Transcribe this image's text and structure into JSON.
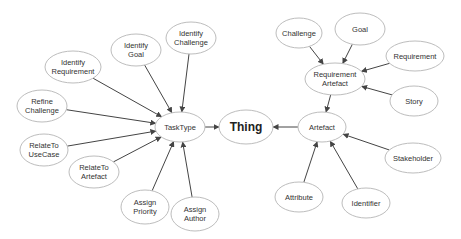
{
  "diagram": {
    "type": "concept-hierarchy",
    "colors": {
      "node_fill": "#ffffff",
      "node_stroke": "#bdbdbd",
      "edge": "#444444",
      "text": "#333333"
    },
    "nodes": [
      {
        "id": "thing",
        "lines": [
          "Thing"
        ],
        "cx": 246,
        "cy": 127,
        "rx": 27,
        "ry": 17,
        "root": true
      },
      {
        "id": "tasktype",
        "lines": [
          "TaskType"
        ],
        "cx": 180,
        "cy": 127,
        "rx": 25,
        "ry": 15
      },
      {
        "id": "artefact",
        "lines": [
          "Artefact"
        ],
        "cx": 322,
        "cy": 127,
        "rx": 24,
        "ry": 15
      },
      {
        "id": "identify-requirement",
        "lines": [
          "Identify",
          "Requirement"
        ],
        "cx": 73,
        "cy": 67,
        "rx": 28,
        "ry": 16
      },
      {
        "id": "identify-goal",
        "lines": [
          "Identify",
          "Goal"
        ],
        "cx": 136,
        "cy": 50,
        "rx": 25,
        "ry": 16
      },
      {
        "id": "identify-challenge",
        "lines": [
          "Identify",
          "Challenge"
        ],
        "cx": 191,
        "cy": 38,
        "rx": 25,
        "ry": 16
      },
      {
        "id": "refine-challenge",
        "lines": [
          "Refine",
          "Challenge"
        ],
        "cx": 42,
        "cy": 106,
        "rx": 25,
        "ry": 16
      },
      {
        "id": "relateto-usecase",
        "lines": [
          "RelateTo",
          "UseCase"
        ],
        "cx": 44,
        "cy": 150,
        "rx": 24,
        "ry": 16
      },
      {
        "id": "relateto-artefact",
        "lines": [
          "RelateTo",
          "Artefact"
        ],
        "cx": 94,
        "cy": 172,
        "rx": 25,
        "ry": 16
      },
      {
        "id": "assign-priority",
        "lines": [
          "Assign",
          "Priority"
        ],
        "cx": 145,
        "cy": 207,
        "rx": 24,
        "ry": 17
      },
      {
        "id": "assign-author",
        "lines": [
          "Assign",
          "Author"
        ],
        "cx": 195,
        "cy": 214,
        "rx": 24,
        "ry": 17
      },
      {
        "id": "requirement-artefact",
        "lines": [
          "Requirement",
          "Artefact"
        ],
        "cx": 335,
        "cy": 79,
        "rx": 30,
        "ry": 16
      },
      {
        "id": "challenge",
        "lines": [
          "Challenge"
        ],
        "cx": 299,
        "cy": 33,
        "rx": 23,
        "ry": 15
      },
      {
        "id": "goal",
        "lines": [
          "Goal"
        ],
        "cx": 360,
        "cy": 29,
        "rx": 25,
        "ry": 16
      },
      {
        "id": "requirement",
        "lines": [
          "Requirement"
        ],
        "cx": 415,
        "cy": 56,
        "rx": 29,
        "ry": 15
      },
      {
        "id": "story",
        "lines": [
          "Story"
        ],
        "cx": 414,
        "cy": 101,
        "rx": 24,
        "ry": 15
      },
      {
        "id": "stakeholder",
        "lines": [
          "Stakeholder"
        ],
        "cx": 413,
        "cy": 158,
        "rx": 28,
        "ry": 15
      },
      {
        "id": "attribute",
        "lines": [
          "Attribute"
        ],
        "cx": 299,
        "cy": 197,
        "rx": 24,
        "ry": 15
      },
      {
        "id": "identifier",
        "lines": [
          "Identifier"
        ],
        "cx": 366,
        "cy": 203,
        "rx": 24,
        "ry": 15
      }
    ],
    "edges": [
      {
        "from": "tasktype",
        "to": "thing"
      },
      {
        "from": "artefact",
        "to": "thing"
      },
      {
        "from": "identify-requirement",
        "to": "tasktype"
      },
      {
        "from": "identify-goal",
        "to": "tasktype"
      },
      {
        "from": "identify-challenge",
        "to": "tasktype"
      },
      {
        "from": "refine-challenge",
        "to": "tasktype"
      },
      {
        "from": "relateto-usecase",
        "to": "tasktype"
      },
      {
        "from": "relateto-artefact",
        "to": "tasktype"
      },
      {
        "from": "assign-priority",
        "to": "tasktype"
      },
      {
        "from": "assign-author",
        "to": "tasktype"
      },
      {
        "from": "requirement-artefact",
        "to": "artefact"
      },
      {
        "from": "challenge",
        "to": "requirement-artefact"
      },
      {
        "from": "goal",
        "to": "requirement-artefact"
      },
      {
        "from": "requirement",
        "to": "requirement-artefact"
      },
      {
        "from": "story",
        "to": "requirement-artefact"
      },
      {
        "from": "stakeholder",
        "to": "artefact"
      },
      {
        "from": "attribute",
        "to": "artefact"
      },
      {
        "from": "identifier",
        "to": "artefact"
      }
    ]
  }
}
